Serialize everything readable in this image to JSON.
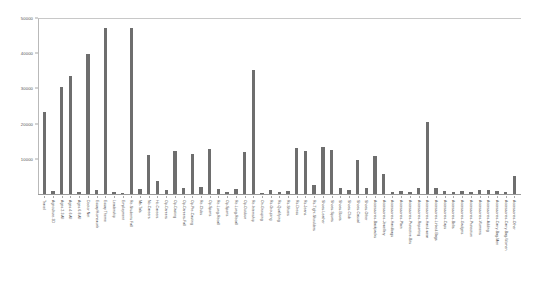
{
  "chart_data": {
    "type": "bar",
    "title": "",
    "subtitle": "",
    "xlabel": "",
    "ylabel": "",
    "ylim": [
      0,
      50000
    ],
    "grid": false,
    "legend": null,
    "bar_color": "#6e6e6e",
    "background_color": "#ffffff",
    "ytick_labels": [
      "50000",
      "40000",
      "30000",
      "20000",
      "10000"
    ],
    "ytick_values": [
      50000,
      40000,
      30000,
      20000,
      10000
    ],
    "categories": [
      "Travel",
      "Agriculture-3D",
      "Ages 2-3 All",
      "Ages 4-6 All",
      "Ages 6-8 All",
      "Doctor Net",
      "Essay/Homework",
      "Essay Theme",
      "Leadership",
      "Employment",
      "Re-Students Fall",
      "Me-Tals",
      "No-Careers",
      "Hc-Careers",
      "Op-Careers",
      "Op-Casting",
      "Op-Careers-Fall",
      "Op-Pre-Casting",
      "Re-Clubs",
      "Op-Sports",
      "Re-Long-Recall",
      "Op-Sports",
      "Re-Long-Recall",
      "Op-Outdoor",
      "Re-Internship",
      "On-Grouping",
      "Rs-Grouping",
      "Rs-Qualifying",
      "Rs-Shoes",
      "Rs-Dress",
      "Rs-Jeans",
      "Rs-Tight-Shoulders",
      "Shoes-Leather",
      "Shoes-Sports",
      "Shoes-Boots",
      "Shoes-Club",
      "Shoes-Casual",
      "Shoes-Other",
      "Accessories-Backpacks",
      "Accessories-Jewellery",
      "Accessories-Handbags",
      "Accessories-Plain",
      "Accessories-Protective-Bits",
      "Accessories-Reporting",
      "Accessories-Hand-wear",
      "Accessories-Linked-Bags",
      "Accessories-Caps",
      "Accessories-Belts",
      "Accessories-Gadgets",
      "Accessories-Protection",
      "Accessories-Womens",
      "Accessories-Adding",
      "Accessories-Carry-Bag-Men",
      "Accessories-Carry-Bag-Women",
      "Accessories-Other"
    ],
    "values": [
      23200,
      900,
      30400,
      33600,
      600,
      39800,
      1000,
      47300,
      600,
      300,
      47100,
      1500,
      11000,
      3800,
      1100,
      12200,
      1700,
      11300,
      2000,
      12800,
      1300,
      700,
      1500,
      12000,
      35100,
      300,
      1100,
      700,
      800,
      13000,
      12100,
      2500,
      13400,
      12400,
      1600,
      1200,
      9700,
      1700,
      10800,
      5600,
      600,
      800,
      700,
      1800,
      20500,
      1700,
      800,
      600,
      900,
      700,
      1000,
      1200,
      800,
      700,
      5200
    ]
  }
}
